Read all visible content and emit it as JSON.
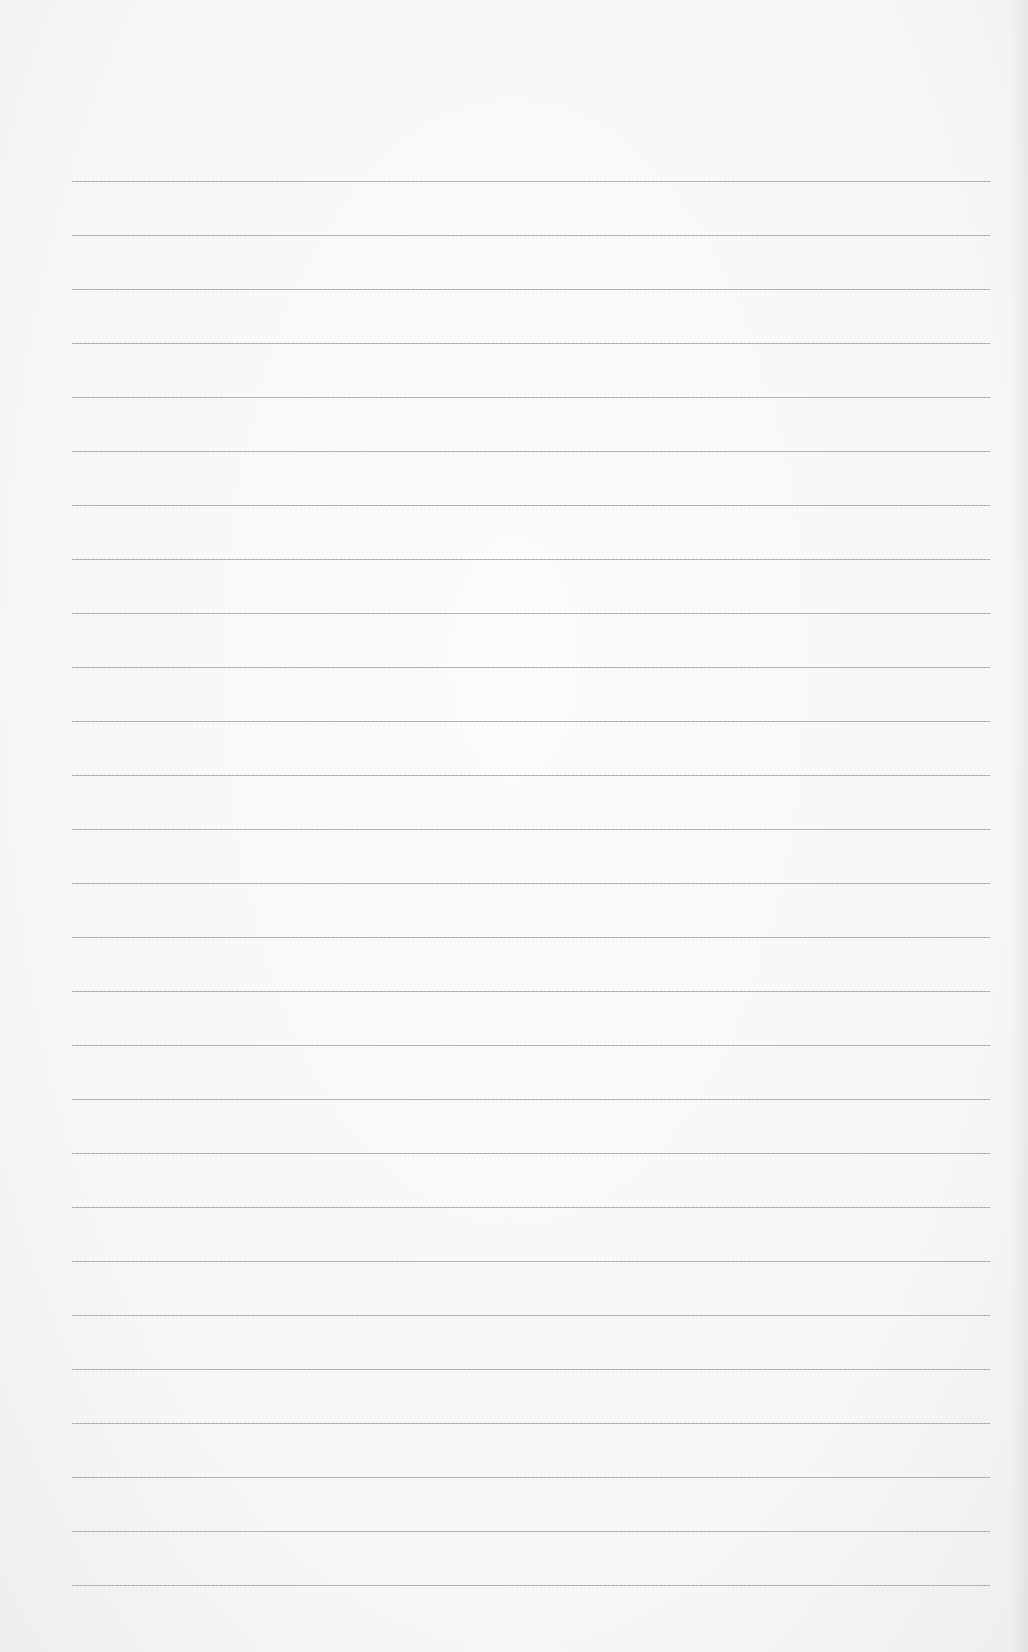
{
  "page": {
    "type": "lined-paper",
    "background_color": "#f7f7f5",
    "line_color": "#a8a8a8",
    "lines": {
      "count": 27,
      "first_y": 181,
      "spacing": 54,
      "left_x": 72,
      "right_x": 990
    },
    "content": ""
  }
}
